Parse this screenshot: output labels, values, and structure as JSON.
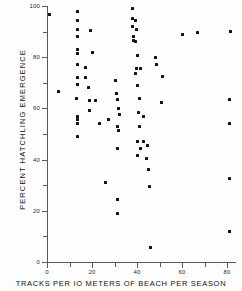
{
  "chart_data": {
    "type": "scatter",
    "title": "",
    "xlabel": "TRACKS PER IO METERS OF BEACH PER SEASON",
    "ylabel": "PERCENT HATCHLING EMERGENCE",
    "xlim": [
      0,
      84
    ],
    "ylim": [
      0,
      100
    ],
    "xticks": [
      0,
      20,
      40,
      60,
      80
    ],
    "xticklabels": [
      "0",
      "20",
      "40",
      "60",
      "80"
    ],
    "xminorticks": [
      10,
      30,
      50,
      70
    ],
    "yticks": [
      0,
      20,
      40,
      60,
      80,
      100
    ],
    "yticklabels": [
      "0",
      "20",
      "40",
      "60",
      "80",
      "100"
    ],
    "yminorticks": [
      10,
      30,
      50,
      70,
      90
    ],
    "grid": false,
    "legend": null,
    "marker": "square",
    "marker_color": "#111111",
    "points": [
      {
        "x": 1.3,
        "y": 96.5
      },
      {
        "x": 5.0,
        "y": 66.5
      },
      {
        "x": 13.5,
        "y": 69.5
      },
      {
        "x": 17.0,
        "y": 76.0
      },
      {
        "x": 17.3,
        "y": 72.0
      },
      {
        "x": 18.5,
        "y": 68.0
      },
      {
        "x": 18.8,
        "y": 63.0
      },
      {
        "x": 19.0,
        "y": 59.0
      },
      {
        "x": 13.4,
        "y": 98.0
      },
      {
        "x": 13.4,
        "y": 94.5
      },
      {
        "x": 13.4,
        "y": 91.0
      },
      {
        "x": 13.4,
        "y": 88.0
      },
      {
        "x": 13.5,
        "y": 83.0
      },
      {
        "x": 13.5,
        "y": 81.5
      },
      {
        "x": 13.4,
        "y": 77.0
      },
      {
        "x": 13.4,
        "y": 72.0
      },
      {
        "x": 13.4,
        "y": 69.5
      },
      {
        "x": 13.3,
        "y": 64.0
      },
      {
        "x": 13.4,
        "y": 57.0
      },
      {
        "x": 13.4,
        "y": 55.5
      },
      {
        "x": 13.4,
        "y": 54.0
      },
      {
        "x": 13.4,
        "y": 49.0
      },
      {
        "x": 19.2,
        "y": 90.5
      },
      {
        "x": 20.0,
        "y": 82.0
      },
      {
        "x": 21.5,
        "y": 63.0
      },
      {
        "x": 23.5,
        "y": 54.0
      },
      {
        "x": 25.8,
        "y": 31.0
      },
      {
        "x": 27.5,
        "y": 55.5
      },
      {
        "x": 30.5,
        "y": 71.0
      },
      {
        "x": 31.0,
        "y": 66.0
      },
      {
        "x": 31.5,
        "y": 63.5
      },
      {
        "x": 31.8,
        "y": 60.0
      },
      {
        "x": 32.0,
        "y": 57.5
      },
      {
        "x": 31.5,
        "y": 53.0
      },
      {
        "x": 31.6,
        "y": 51.5
      },
      {
        "x": 31.5,
        "y": 44.5
      },
      {
        "x": 31.5,
        "y": 24.5
      },
      {
        "x": 31.5,
        "y": 19.0
      },
      {
        "x": 38.0,
        "y": 99.0
      },
      {
        "x": 38.2,
        "y": 95.0
      },
      {
        "x": 38.0,
        "y": 92.0
      },
      {
        "x": 39.5,
        "y": 94.5
      },
      {
        "x": 39.8,
        "y": 91.0
      },
      {
        "x": 38.3,
        "y": 88.0
      },
      {
        "x": 38.5,
        "y": 86.5
      },
      {
        "x": 39.5,
        "y": 86.0
      },
      {
        "x": 40.0,
        "y": 80.5
      },
      {
        "x": 39.8,
        "y": 75.5
      },
      {
        "x": 39.5,
        "y": 73.5
      },
      {
        "x": 40.0,
        "y": 69.0
      },
      {
        "x": 41.5,
        "y": 75.5
      },
      {
        "x": 41.0,
        "y": 64.0
      },
      {
        "x": 40.5,
        "y": 58.5
      },
      {
        "x": 41.0,
        "y": 53.0
      },
      {
        "x": 40.0,
        "y": 47.0
      },
      {
        "x": 41.5,
        "y": 44.5
      },
      {
        "x": 40.0,
        "y": 41.5
      },
      {
        "x": 43.0,
        "y": 57.0
      },
      {
        "x": 43.0,
        "y": 47.0
      },
      {
        "x": 44.5,
        "y": 45.5
      },
      {
        "x": 44.0,
        "y": 40.5
      },
      {
        "x": 45.0,
        "y": 36.0
      },
      {
        "x": 45.5,
        "y": 29.5
      },
      {
        "x": 46.0,
        "y": 5.5
      },
      {
        "x": 48.0,
        "y": 80.0
      },
      {
        "x": 48.5,
        "y": 77.0
      },
      {
        "x": 51.5,
        "y": 72.5
      },
      {
        "x": 51.0,
        "y": 62.5
      },
      {
        "x": 60.0,
        "y": 89.0
      },
      {
        "x": 67.0,
        "y": 89.5
      },
      {
        "x": 81.5,
        "y": 90.0
      },
      {
        "x": 81.0,
        "y": 63.5
      },
      {
        "x": 81.0,
        "y": 54.0
      },
      {
        "x": 81.0,
        "y": 32.5
      },
      {
        "x": 81.0,
        "y": 12.0
      }
    ]
  }
}
